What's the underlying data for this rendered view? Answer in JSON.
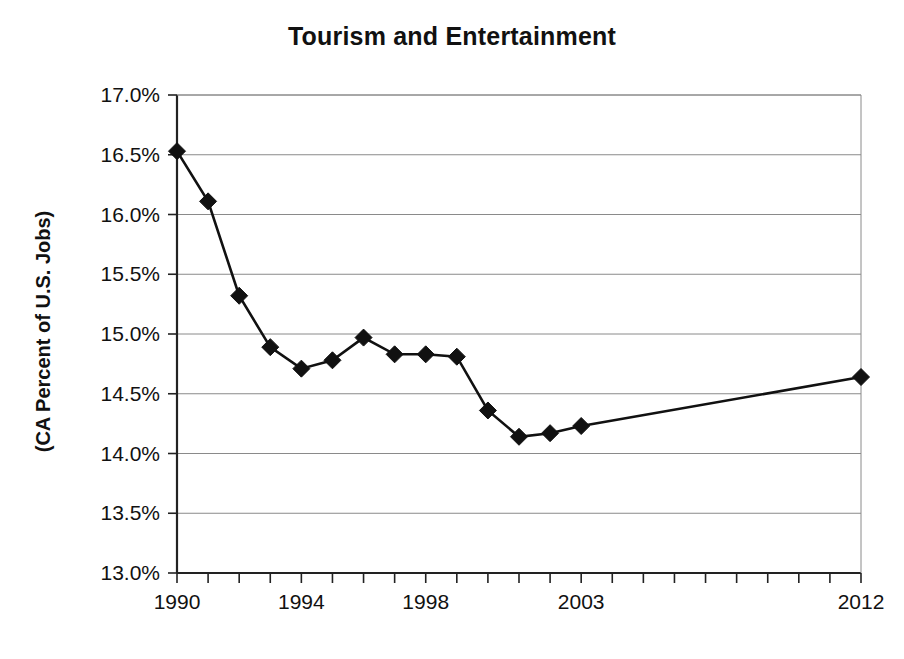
{
  "chart_data": {
    "type": "line",
    "title": "Tourism and Entertainment",
    "xlabel": "",
    "ylabel": "(CA Percent of U.S. Jobs)",
    "x": [
      1990,
      1991,
      1992,
      1993,
      1994,
      1995,
      1996,
      1997,
      1998,
      1999,
      2000,
      2001,
      2002,
      2003,
      2012
    ],
    "values": [
      16.53,
      16.11,
      15.32,
      14.89,
      14.71,
      14.78,
      14.97,
      14.83,
      14.83,
      14.81,
      14.36,
      14.14,
      14.17,
      14.23,
      14.64
    ],
    "series": [
      {
        "name": "CA Percent of U.S. Jobs",
        "values": [
          16.53,
          16.11,
          15.32,
          14.89,
          14.71,
          14.78,
          14.97,
          14.83,
          14.83,
          14.81,
          14.36,
          14.14,
          14.17,
          14.23,
          14.64
        ]
      }
    ],
    "xlim": [
      1990,
      2012
    ],
    "ylim": [
      13.0,
      17.0
    ],
    "y_tick_labels": [
      "17.0%",
      "16.5%",
      "16.0%",
      "15.5%",
      "15.0%",
      "14.5%",
      "14.0%",
      "13.5%",
      "13.0%"
    ],
    "y_tick_values": [
      17.0,
      16.5,
      16.0,
      15.5,
      15.0,
      14.5,
      14.0,
      13.5,
      13.0
    ],
    "x_tick_labels": [
      "1990",
      "1994",
      "1998",
      "2003",
      "2012"
    ],
    "x_tick_label_values": [
      1990,
      1994,
      1998,
      2003,
      2012
    ],
    "x_tick_all": [
      1990,
      1991,
      1992,
      1993,
      1994,
      1995,
      1996,
      1997,
      1998,
      1999,
      2000,
      2001,
      2002,
      2003,
      2004,
      2005,
      2006,
      2007,
      2008,
      2009,
      2010,
      2011,
      2012
    ],
    "grid": "horizontal",
    "legend": "none",
    "marker": "diamond",
    "line_color": "#111111",
    "marker_color": "#111111",
    "grid_color": "#8a8a8a"
  }
}
